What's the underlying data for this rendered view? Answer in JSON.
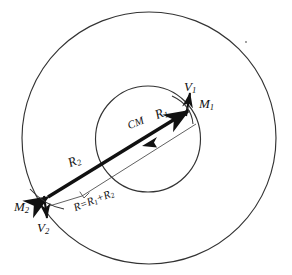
{
  "figure": {
    "background_color": "#ffffff",
    "stroke_color": "#1a1a1a",
    "labels": {
      "mass_one": "M",
      "mass_one_sub": "1",
      "mass_two": "M",
      "mass_two_sub": "2",
      "velocity_one": "V",
      "velocity_one_sub": "1",
      "velocity_two": "V",
      "velocity_two_sub": "2",
      "center_of_mass": "CM",
      "radius_one": "R",
      "radius_one_sub": "1",
      "radius_two": "R",
      "radius_two_sub": "2",
      "total_separation": "R=R",
      "total_separation_sub1": "1",
      "total_separation_mid": "+R",
      "total_separation_sub2": "2"
    },
    "geometry": {
      "outer_orbit_center_x": 149,
      "outer_orbit_center_y": 138,
      "outer_orbit_radius": 127,
      "inner_orbit_center_x": 148,
      "inner_orbit_center_y": 139,
      "inner_orbit_radius": 53,
      "mass_one_x": 192,
      "mass_one_y": 108,
      "mass_two_x": 40,
      "mass_two_y": 201,
      "center_of_mass_x": 150,
      "center_of_mass_y": 142
    }
  }
}
